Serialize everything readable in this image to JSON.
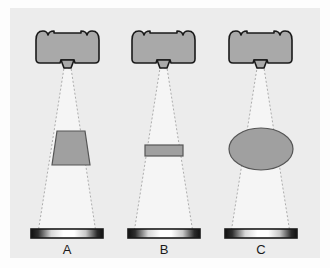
{
  "figure": {
    "title": "",
    "background_color": "#ececec",
    "outer_background_color": "#fdfdfd",
    "shape_fill": "#a9a9a9",
    "shape_stroke": "#1a1a1a",
    "cone_fill": "#f5f5f5",
    "cone_stroke": "#9a9a9a",
    "bar_border_color": "#1a1a1a"
  },
  "panels": [
    {
      "id": "A",
      "label": "A",
      "projector_name": "projector-a",
      "cone_name": "light-cone-a",
      "obstruction": {
        "kind": "trapezoid",
        "name": "trapezoid-shape-a",
        "fill": "#a0a0a0"
      },
      "target_bar": {
        "name": "gradient-bar-a",
        "gradient": "dark-light-dark",
        "edge_color": "#151515",
        "center_color": "#ffffff"
      }
    },
    {
      "id": "B",
      "label": "B",
      "projector_name": "projector-b",
      "cone_name": "light-cone-b",
      "obstruction": {
        "kind": "thin-rectangle",
        "name": "rectangle-shape-b",
        "fill": "#a0a0a0"
      },
      "target_bar": {
        "name": "gradient-bar-b",
        "gradient": "dark-light-dark",
        "edge_color": "#151515",
        "center_color": "#ffffff"
      }
    },
    {
      "id": "C",
      "label": "C",
      "projector_name": "projector-c",
      "cone_name": "light-cone-c",
      "obstruction": {
        "kind": "ellipse",
        "name": "ellipse-shape-c",
        "fill": "#a0a0a0"
      },
      "target_bar": {
        "name": "gradient-bar-c",
        "gradient": "dark-light-dark",
        "edge_color": "#151515",
        "center_color": "#ffffff"
      }
    }
  ],
  "captions": {
    "a": "A",
    "b": "B",
    "c": "C"
  }
}
